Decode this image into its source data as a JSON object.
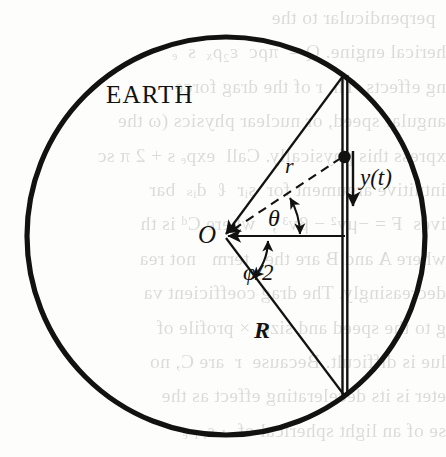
{
  "figure": {
    "labels": {
      "body": "EARTH",
      "center": "O",
      "radial_distance": "r",
      "radius": "R",
      "theta": "θ",
      "phi_half": "φ/2",
      "displacement": "y(t)"
    },
    "colors": {
      "ink": "#121210",
      "paper": "#fdfdfb",
      "bleed": "#3a3a38"
    },
    "geometry": {
      "circle_center_x": 226,
      "circle_center_y": 236,
      "circle_radius": 199,
      "circle_stroke_width": 5,
      "center_point_x": 222,
      "center_point_y": 235,
      "tunnel_x_left": 342,
      "tunnel_x_right": 347,
      "tunnel_top_y": 75,
      "tunnel_bottom_y": 395,
      "particle_x": 342,
      "particle_y": 157,
      "particle_radius": 6,
      "arrow_y_x": 352,
      "arrow_y_top": 152,
      "arrow_y_bottom": 208
    }
  },
  "bleed_text": "  perpendicular to the\nherical engine. Q =  πρc  ε₂ρₓ  s  ₑ\nng effects. Th  r of the drag force\nangular speed, or nuclear physics (ω the\nxpress this physically. Call  expₑ s + 2 π sc\nintuitive argument for  sᵢr  ℓ  dᵢₛ  bar\nives  F = −μv² − βv³ ,   where Cᵈ is th\nwhere A and B are the   term   not rea\ndecreasingly. The drag coefficient va\ng to the speed and size  × profile of\nlue is difficult. Because  r  are C, no\neter is its decelerating effect as the\nse of an light spherical of  · sᵢ ᵣ ₑ"
}
